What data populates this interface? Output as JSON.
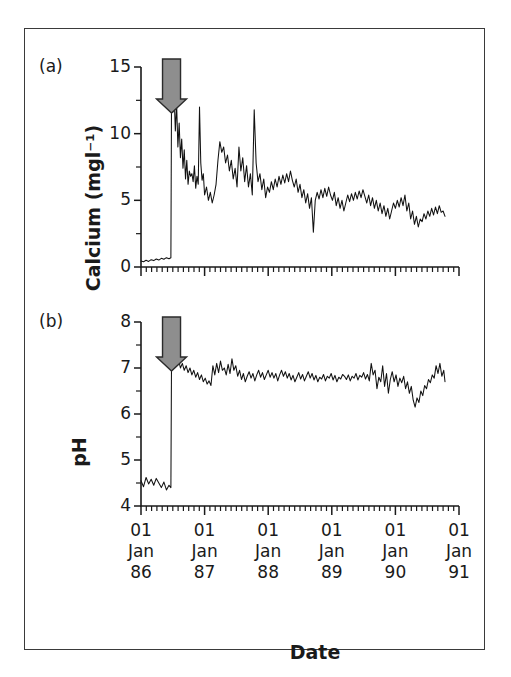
{
  "figure": {
    "background": "#ffffff",
    "frame_color": "#3a3a3a",
    "line_color": "#111111",
    "arrow_fill": "#8e8e8e",
    "arrow_stroke": "#2b2b2b"
  },
  "panels": {
    "a": {
      "tag": "(a)"
    },
    "b": {
      "tag": "(b)"
    }
  },
  "axes": {
    "x_title": "Date",
    "x_tick_labels": [
      {
        "day": "01",
        "month": "Jan",
        "year": "86"
      },
      {
        "day": "01",
        "month": "Jan",
        "year": "87"
      },
      {
        "day": "01",
        "month": "Jan",
        "year": "88"
      },
      {
        "day": "01",
        "month": "Jan",
        "year": "89"
      },
      {
        "day": "01",
        "month": "Jan",
        "year": "90"
      },
      {
        "day": "01",
        "month": "Jan",
        "year": "91"
      }
    ],
    "calcium_title": "Calcium (mgl⁻¹)",
    "calcium_ticks": [
      "0",
      "5",
      "10",
      "15"
    ],
    "ph_title": "pH",
    "ph_ticks": [
      "4",
      "5",
      "6",
      "7",
      "8"
    ]
  },
  "annotations": {
    "arrow_label": "liming-event-arrow",
    "arrow_date": "1986.48"
  },
  "chart_data": [
    {
      "type": "line",
      "panel": "a",
      "title": "",
      "xlabel": "Date",
      "ylabel": "Calcium (mgl⁻¹)",
      "xlim": [
        1986.0,
        1991.0
      ],
      "ylim": [
        0,
        15
      ],
      "yticks": [
        0,
        5,
        10,
        15
      ],
      "yticks_minor": [
        2.5,
        7.5,
        12.5
      ],
      "xticks": [
        1986,
        1987,
        1988,
        1989,
        1990,
        1991
      ],
      "grid": false,
      "legend": "none",
      "annotation": {
        "type": "down-arrow",
        "x": 1986.48,
        "color": "#8e8e8e"
      },
      "series": [
        {
          "name": "Calcium",
          "x": [
            1986.0,
            1986.04,
            1986.08,
            1986.12,
            1986.16,
            1986.2,
            1986.24,
            1986.28,
            1986.32,
            1986.36,
            1986.4,
            1986.44,
            1986.47,
            1986.48,
            1986.5,
            1986.52,
            1986.54,
            1986.56,
            1986.58,
            1986.6,
            1986.62,
            1986.64,
            1986.66,
            1986.68,
            1986.7,
            1986.72,
            1986.74,
            1986.76,
            1986.78,
            1986.8,
            1986.82,
            1986.84,
            1986.86,
            1986.88,
            1986.9,
            1986.92,
            1986.94,
            1986.96,
            1986.98,
            1987.0,
            1987.03,
            1987.06,
            1987.09,
            1987.12,
            1987.15,
            1987.18,
            1987.21,
            1987.24,
            1987.27,
            1987.3,
            1987.33,
            1987.36,
            1987.39,
            1987.42,
            1987.45,
            1987.48,
            1987.51,
            1987.54,
            1987.57,
            1987.6,
            1987.63,
            1987.66,
            1987.69,
            1987.72,
            1987.75,
            1987.78,
            1987.81,
            1987.84,
            1987.87,
            1987.9,
            1987.93,
            1987.96,
            1987.99,
            1988.02,
            1988.05,
            1988.08,
            1988.11,
            1988.14,
            1988.17,
            1988.2,
            1988.23,
            1988.26,
            1988.29,
            1988.32,
            1988.35,
            1988.38,
            1988.41,
            1988.44,
            1988.47,
            1988.5,
            1988.53,
            1988.56,
            1988.59,
            1988.62,
            1988.65,
            1988.68,
            1988.71,
            1988.74,
            1988.77,
            1988.8,
            1988.83,
            1988.86,
            1988.89,
            1988.92,
            1988.95,
            1988.98,
            1989.01,
            1989.04,
            1989.07,
            1989.1,
            1989.13,
            1989.16,
            1989.19,
            1989.22,
            1989.25,
            1989.28,
            1989.31,
            1989.34,
            1989.37,
            1989.4,
            1989.43,
            1989.46,
            1989.49,
            1989.52,
            1989.55,
            1989.58,
            1989.61,
            1989.64,
            1989.67,
            1989.7,
            1989.73,
            1989.76,
            1989.79,
            1989.82,
            1989.85,
            1989.88,
            1989.91,
            1989.94,
            1989.97,
            1990.0,
            1990.03,
            1990.06,
            1990.09,
            1990.12,
            1990.15,
            1990.18,
            1990.21,
            1990.24,
            1990.27,
            1990.3,
            1990.33,
            1990.36,
            1990.39,
            1990.42,
            1990.45,
            1990.48,
            1990.51,
            1990.54,
            1990.57,
            1990.6,
            1990.63,
            1990.66,
            1990.69,
            1990.72,
            1990.75,
            1990.78
          ],
          "y": [
            0.45,
            0.4,
            0.5,
            0.42,
            0.55,
            0.48,
            0.6,
            0.52,
            0.65,
            0.58,
            0.7,
            0.62,
            0.7,
            12.8,
            11.6,
            13.0,
            10.2,
            12.2,
            9.0,
            10.8,
            8.2,
            9.6,
            7.4,
            8.8,
            6.6,
            8.0,
            6.2,
            7.2,
            6.8,
            7.0,
            6.4,
            7.6,
            5.9,
            6.8,
            6.2,
            12.0,
            7.8,
            6.5,
            7.0,
            5.4,
            6.0,
            5.0,
            5.6,
            4.8,
            5.4,
            6.2,
            8.0,
            9.4,
            8.6,
            9.0,
            7.8,
            8.4,
            7.2,
            8.0,
            6.6,
            7.4,
            6.0,
            9.0,
            7.2,
            8.2,
            6.4,
            7.6,
            6.0,
            7.0,
            5.4,
            11.8,
            7.8,
            6.4,
            7.0,
            5.8,
            6.6,
            5.2,
            6.0,
            5.6,
            6.4,
            5.8,
            6.6,
            6.0,
            6.8,
            6.2,
            6.9,
            6.3,
            7.0,
            6.4,
            7.2,
            6.5,
            6.0,
            6.6,
            5.6,
            6.2,
            5.2,
            5.8,
            4.8,
            5.5,
            4.4,
            5.2,
            2.6,
            5.0,
            5.6,
            5.1,
            5.8,
            5.2,
            5.9,
            5.3,
            6.0,
            5.4,
            5.0,
            5.6,
            4.6,
            5.2,
            4.4,
            5.0,
            4.2,
            4.8,
            5.4,
            4.9,
            5.5,
            5.0,
            5.6,
            5.1,
            5.7,
            5.2,
            5.8,
            5.3,
            4.8,
            5.4,
            4.6,
            5.2,
            4.4,
            5.0,
            4.2,
            4.8,
            4.0,
            4.6,
            3.8,
            4.4,
            3.6,
            4.2,
            4.8,
            4.4,
            5.0,
            4.5,
            5.2,
            4.6,
            5.4,
            4.2,
            4.8,
            3.6,
            4.2,
            3.2,
            3.8,
            3.0,
            3.6,
            3.4,
            4.0,
            3.6,
            4.2,
            3.8,
            4.4,
            3.9,
            4.5,
            4.0,
            4.6,
            4.1,
            4.2,
            3.8,
            4.4,
            4.0
          ]
        }
      ]
    },
    {
      "type": "line",
      "panel": "b",
      "title": "",
      "xlabel": "Date",
      "ylabel": "pH",
      "xlim": [
        1986.0,
        1991.0
      ],
      "ylim": [
        4,
        8
      ],
      "yticks": [
        4,
        5,
        6,
        7,
        8
      ],
      "yticks_minor": [
        4.5,
        5.5,
        6.5,
        7.5
      ],
      "xticks": [
        1986,
        1987,
        1988,
        1989,
        1990,
        1991
      ],
      "grid": false,
      "legend": "none",
      "annotation": {
        "type": "down-arrow",
        "x": 1986.48,
        "color": "#8e8e8e"
      },
      "series": [
        {
          "name": "pH",
          "x": [
            1986.0,
            1986.04,
            1986.08,
            1986.12,
            1986.16,
            1986.2,
            1986.24,
            1986.28,
            1986.32,
            1986.36,
            1986.4,
            1986.44,
            1986.47,
            1986.48,
            1986.5,
            1986.53,
            1986.56,
            1986.59,
            1986.62,
            1986.65,
            1986.68,
            1986.71,
            1986.74,
            1986.77,
            1986.8,
            1986.83,
            1986.86,
            1986.89,
            1986.92,
            1986.95,
            1986.98,
            1987.01,
            1987.04,
            1987.07,
            1987.1,
            1987.13,
            1987.16,
            1987.19,
            1987.22,
            1987.25,
            1987.28,
            1987.31,
            1987.34,
            1987.37,
            1987.4,
            1987.43,
            1987.46,
            1987.49,
            1987.52,
            1987.55,
            1987.58,
            1987.61,
            1987.64,
            1987.67,
            1987.7,
            1987.73,
            1987.76,
            1987.79,
            1987.82,
            1987.85,
            1987.88,
            1987.91,
            1987.94,
            1987.97,
            1988.0,
            1988.03,
            1988.06,
            1988.09,
            1988.12,
            1988.15,
            1988.18,
            1988.21,
            1988.24,
            1988.27,
            1988.3,
            1988.33,
            1988.36,
            1988.39,
            1988.42,
            1988.45,
            1988.48,
            1988.51,
            1988.54,
            1988.57,
            1988.6,
            1988.63,
            1988.66,
            1988.69,
            1988.72,
            1988.75,
            1988.78,
            1988.81,
            1988.84,
            1988.87,
            1988.9,
            1988.93,
            1988.96,
            1988.99,
            1989.02,
            1989.05,
            1989.08,
            1989.11,
            1989.14,
            1989.17,
            1989.2,
            1989.23,
            1989.26,
            1989.29,
            1989.32,
            1989.35,
            1989.38,
            1989.41,
            1989.44,
            1989.47,
            1989.5,
            1989.53,
            1989.56,
            1989.59,
            1989.62,
            1989.65,
            1989.68,
            1989.71,
            1989.74,
            1989.77,
            1989.8,
            1989.83,
            1989.86,
            1989.89,
            1989.92,
            1989.95,
            1989.98,
            1990.01,
            1990.04,
            1990.07,
            1990.1,
            1990.13,
            1990.16,
            1990.19,
            1990.22,
            1990.25,
            1990.28,
            1990.31,
            1990.34,
            1990.37,
            1990.4,
            1990.43,
            1990.46,
            1990.49,
            1990.52,
            1990.55,
            1990.58,
            1990.61,
            1990.64,
            1990.67,
            1990.7,
            1990.73,
            1990.76,
            1990.78
          ],
          "y": [
            4.55,
            4.42,
            4.62,
            4.48,
            4.58,
            4.45,
            4.6,
            4.5,
            4.4,
            4.52,
            4.35,
            4.45,
            4.4,
            7.25,
            7.15,
            7.22,
            7.05,
            7.18,
            7.0,
            7.1,
            6.95,
            7.05,
            6.9,
            7.0,
            6.85,
            6.95,
            6.8,
            6.9,
            6.75,
            6.85,
            6.7,
            6.78,
            6.65,
            6.72,
            6.62,
            7.05,
            6.85,
            7.1,
            6.9,
            7.15,
            6.95,
            7.0,
            6.85,
            7.08,
            6.88,
            7.2,
            6.95,
            7.05,
            6.82,
            6.95,
            6.75,
            6.88,
            6.7,
            6.82,
            6.92,
            6.78,
            6.88,
            6.72,
            6.85,
            6.95,
            6.8,
            6.9,
            6.75,
            6.85,
            6.95,
            6.8,
            6.9,
            6.78,
            6.88,
            6.72,
            6.85,
            6.95,
            6.82,
            6.92,
            6.78,
            6.88,
            6.74,
            6.84,
            6.7,
            6.8,
            6.9,
            6.76,
            6.86,
            6.72,
            6.82,
            6.92,
            6.78,
            6.88,
            6.74,
            6.84,
            6.7,
            6.8,
            6.76,
            6.86,
            6.72,
            6.82,
            6.78,
            6.88,
            6.74,
            6.84,
            6.7,
            6.8,
            6.76,
            6.86,
            6.82,
            6.75,
            6.85,
            6.72,
            6.82,
            6.78,
            6.88,
            6.74,
            6.84,
            6.8,
            6.9,
            6.76,
            6.86,
            6.72,
            7.1,
            6.85,
            6.95,
            6.55,
            6.8,
            6.7,
            7.05,
            6.6,
            6.88,
            6.45,
            6.75,
            6.92,
            6.7,
            6.85,
            6.6,
            6.78,
            6.68,
            6.82,
            6.55,
            6.7,
            6.45,
            6.6,
            6.3,
            6.15,
            6.35,
            6.25,
            6.5,
            6.4,
            6.62,
            6.55,
            6.75,
            6.68,
            6.85,
            6.78,
            7.05,
            6.88,
            7.1,
            6.82,
            6.95,
            6.7,
            6.85,
            6.8,
            6.88
          ]
        }
      ]
    }
  ]
}
